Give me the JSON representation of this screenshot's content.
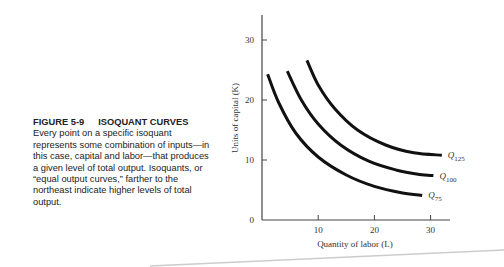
{
  "caption": {
    "figure_number": "FIGURE 5-9",
    "figure_title": "ISOQUANT CURVES",
    "body": "Every point on a specific isoquant represents some combination of inputs—in this case, capital and labor—that produces a given level of total output. Isoquants, or “equal output curves,” farther to the northeast indicate higher levels of total output."
  },
  "chart_data": {
    "type": "line",
    "title": "Isoquant Curves",
    "xlabel": "Quantity of labor (L)",
    "ylabel": "Units of capital (K)",
    "xlim": [
      0,
      35
    ],
    "ylim": [
      0,
      34
    ],
    "x_ticks": [
      10,
      20,
      30
    ],
    "y_ticks": [
      0,
      10,
      20,
      30
    ],
    "grid": false,
    "legend": "inline labels at curve ends",
    "series": [
      {
        "name": "Q75",
        "label_main": "Q",
        "label_sub": "75",
        "points": [
          [
            1,
            24.3
          ],
          [
            3,
            19.5
          ],
          [
            6,
            14.5
          ],
          [
            10,
            10.5
          ],
          [
            15,
            7.5
          ],
          [
            20,
            5.6
          ],
          [
            25,
            4.5
          ],
          [
            28.5,
            4.1
          ]
        ]
      },
      {
        "name": "Q100",
        "label_main": "Q",
        "label_sub": "100",
        "points": [
          [
            4.5,
            24.8
          ],
          [
            7,
            20
          ],
          [
            10,
            16
          ],
          [
            14,
            12.5
          ],
          [
            19,
            9.8
          ],
          [
            24,
            8.3
          ],
          [
            28,
            7.6
          ],
          [
            30.5,
            7.4
          ]
        ]
      },
      {
        "name": "Q125",
        "label_main": "Q",
        "label_sub": "125",
        "points": [
          [
            8,
            26.6
          ],
          [
            10,
            22.5
          ],
          [
            13,
            18.5
          ],
          [
            17,
            15
          ],
          [
            22,
            12.5
          ],
          [
            27,
            11.2
          ],
          [
            32,
            10.8
          ]
        ]
      }
    ]
  }
}
